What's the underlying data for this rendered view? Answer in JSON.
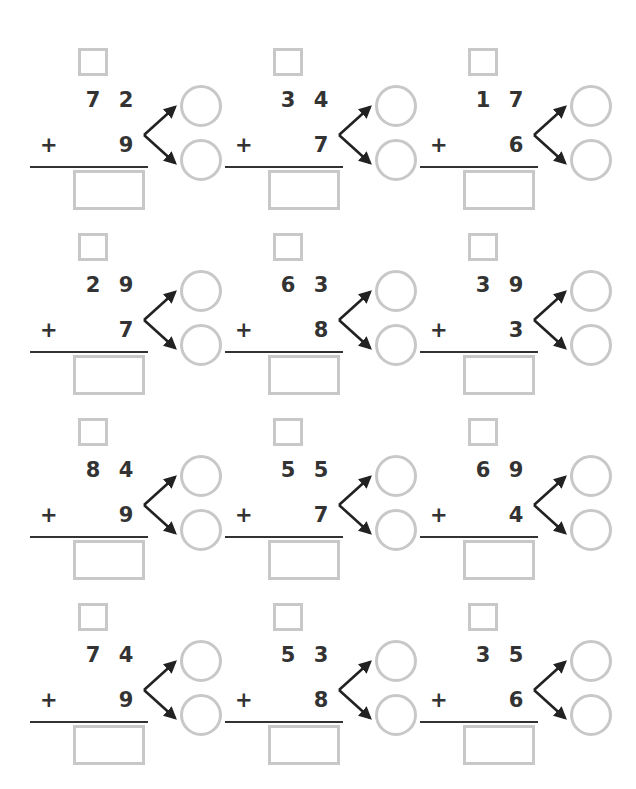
{
  "page": {
    "background_color": "#ffffff",
    "text_color": "#333333",
    "box_color": "#c8c8c8",
    "line_color": "#333333",
    "columns": 3,
    "rows": 4
  },
  "symbols": {
    "plus": "+",
    "carry_box_value": "",
    "answer_box_value": "",
    "circle_top_value": "",
    "circle_bottom_value": ""
  },
  "problems": [
    {
      "id": "problem-1",
      "tens": "7",
      "ones": "2",
      "operator": "+",
      "addend": "9",
      "carry": "",
      "answer": "",
      "part_top": "",
      "part_bottom": ""
    },
    {
      "id": "problem-2",
      "tens": "3",
      "ones": "4",
      "operator": "+",
      "addend": "7",
      "carry": "",
      "answer": "",
      "part_top": "",
      "part_bottom": ""
    },
    {
      "id": "problem-3",
      "tens": "1",
      "ones": "7",
      "operator": "+",
      "addend": "6",
      "carry": "",
      "answer": "",
      "part_top": "",
      "part_bottom": ""
    },
    {
      "id": "problem-4",
      "tens": "2",
      "ones": "9",
      "operator": "+",
      "addend": "7",
      "carry": "",
      "answer": "",
      "part_top": "",
      "part_bottom": ""
    },
    {
      "id": "problem-5",
      "tens": "6",
      "ones": "3",
      "operator": "+",
      "addend": "8",
      "carry": "",
      "answer": "",
      "part_top": "",
      "part_bottom": ""
    },
    {
      "id": "problem-6",
      "tens": "3",
      "ones": "9",
      "operator": "+",
      "addend": "3",
      "carry": "",
      "answer": "",
      "part_top": "",
      "part_bottom": ""
    },
    {
      "id": "problem-7",
      "tens": "8",
      "ones": "4",
      "operator": "+",
      "addend": "9",
      "carry": "",
      "answer": "",
      "part_top": "",
      "part_bottom": ""
    },
    {
      "id": "problem-8",
      "tens": "5",
      "ones": "5",
      "operator": "+",
      "addend": "7",
      "carry": "",
      "answer": "",
      "part_top": "",
      "part_bottom": ""
    },
    {
      "id": "problem-9",
      "tens": "6",
      "ones": "9",
      "operator": "+",
      "addend": "4",
      "carry": "",
      "answer": "",
      "part_top": "",
      "part_bottom": ""
    },
    {
      "id": "problem-10",
      "tens": "7",
      "ones": "4",
      "operator": "+",
      "addend": "9",
      "carry": "",
      "answer": "",
      "part_top": "",
      "part_bottom": ""
    },
    {
      "id": "problem-11",
      "tens": "5",
      "ones": "3",
      "operator": "+",
      "addend": "8",
      "carry": "",
      "answer": "",
      "part_top": "",
      "part_bottom": ""
    },
    {
      "id": "problem-12",
      "tens": "3",
      "ones": "5",
      "operator": "+",
      "addend": "6",
      "carry": "",
      "answer": "",
      "part_top": "",
      "part_bottom": ""
    }
  ]
}
